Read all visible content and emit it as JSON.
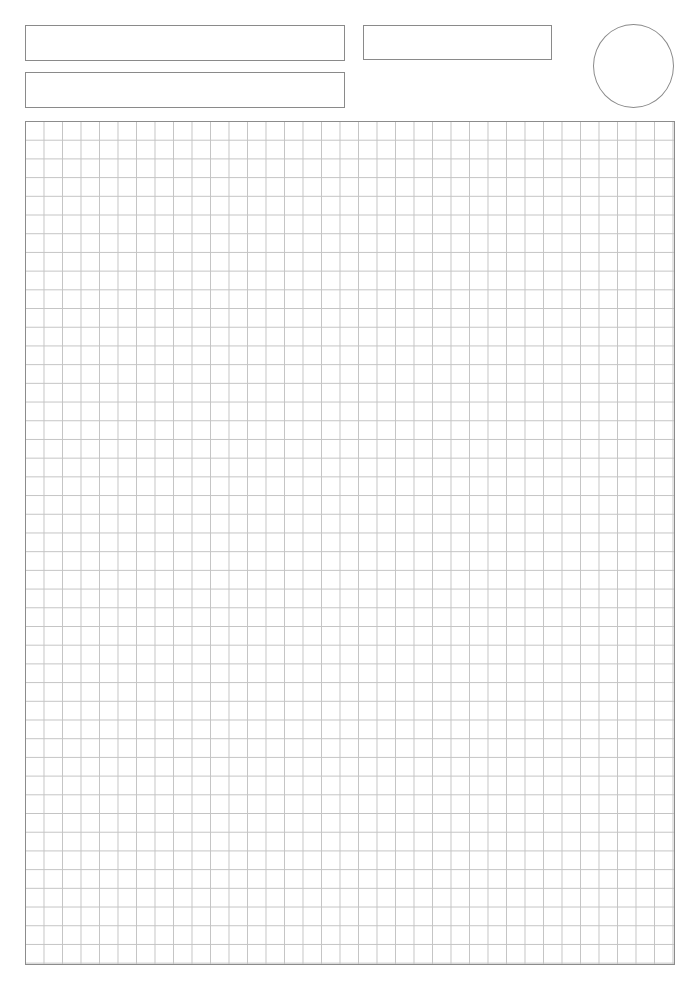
{
  "page": {
    "background": "#ffffff",
    "line_color": "#8a8a8a",
    "grid_line_color": "#c4c4c4"
  },
  "header": {
    "fields": [
      {
        "name": "field-top-left",
        "x": 25,
        "y": 25,
        "w": 320,
        "h": 36,
        "value": ""
      },
      {
        "name": "field-top-middle",
        "x": 363,
        "y": 25,
        "w": 189,
        "h": 35,
        "value": ""
      },
      {
        "name": "field-second-row",
        "x": 25,
        "y": 72,
        "w": 320,
        "h": 36,
        "value": ""
      }
    ],
    "circle": {
      "x": 593,
      "y": 24,
      "w": 81,
      "h": 84
    }
  },
  "grid": {
    "x": 25,
    "y": 121,
    "w": 650,
    "h": 844,
    "columns": 35,
    "rows": 45,
    "cell_w": 18.55,
    "cell_h": 18.75
  }
}
